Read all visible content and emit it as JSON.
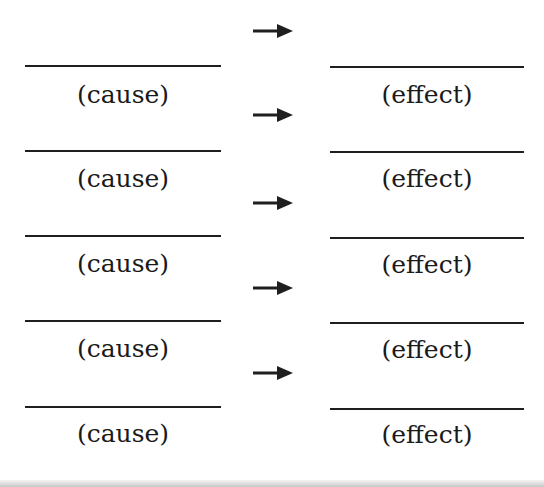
{
  "diagram": {
    "title": "",
    "rows": [
      {
        "cause_label": "(cause)",
        "effect_label": "(effect)"
      },
      {
        "cause_label": "(cause)",
        "effect_label": "(effect)"
      },
      {
        "cause_label": "(cause)",
        "effect_label": "(effect)"
      },
      {
        "cause_label": "(cause)",
        "effect_label": "(effect)"
      },
      {
        "cause_label": "(cause)",
        "effect_label": "(effect)"
      }
    ],
    "arrows": [
      {
        "icon": "arrow-right-icon"
      },
      {
        "icon": "arrow-right-icon"
      },
      {
        "icon": "arrow-right-icon"
      },
      {
        "icon": "arrow-right-icon"
      },
      {
        "icon": "arrow-right-icon"
      }
    ],
    "colors": {
      "ink": "#1f1f1f",
      "background": "#ffffff"
    }
  }
}
